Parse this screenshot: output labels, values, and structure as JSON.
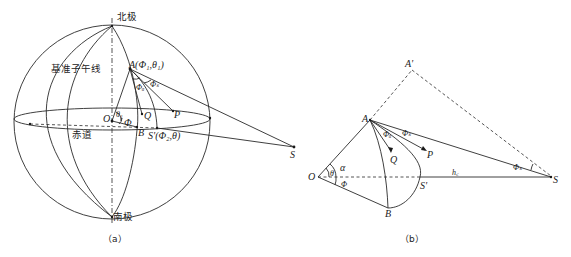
{
  "figure_a": {
    "caption": "（a）",
    "labels": {
      "north_pole": "北极",
      "south_pole": "南极",
      "prime_meridian": "基准子午线",
      "equator": "赤道",
      "point_a": "A(Φ₁,θ₁)",
      "point_o": "O",
      "point_q": "Q",
      "point_p": "P",
      "point_b": "B",
      "point_s_prime": "S'(Φ₂,θ)",
      "point_s": "S",
      "angle_theta1": "θ₁",
      "angle_phi": "Φ",
      "angle_phi_a": "Φₐ",
      "angle_phi_s": "Φₛ"
    }
  },
  "figure_b": {
    "caption": "（b）",
    "labels": {
      "point_a_prime": "A'",
      "point_a": "A",
      "point_o": "O",
      "point_q": "Q",
      "point_p": "P",
      "point_b": "B",
      "point_s_prime": "S'",
      "point_s": "S",
      "angle_alpha": "α",
      "angle_theta": "θ",
      "angle_phi": "Φ",
      "angle_phi_a": "Φₐ",
      "angle_phi_s": "Φₛ",
      "angle_phi_s2": "Φₛ",
      "height": "h꜀"
    }
  }
}
